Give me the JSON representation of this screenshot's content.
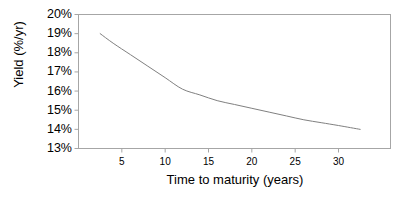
{
  "chart_data": {
    "type": "line",
    "title": "",
    "xlabel": "Time to maturity (years)",
    "ylabel": "Yield (%/yr)",
    "xlim": [
      0,
      36
    ],
    "ylim": [
      13,
      20
    ],
    "grid": false,
    "legend": null,
    "xticks": [
      5,
      10,
      15,
      20,
      25,
      30
    ],
    "xtick_labels": [
      "5",
      "10",
      "15",
      "20",
      "25",
      "30"
    ],
    "yticks": [
      13,
      14,
      15,
      16,
      17,
      18,
      19,
      20
    ],
    "ytick_labels": [
      "13%",
      "14%",
      "15%",
      "16%",
      "17%",
      "18%",
      "19%",
      "20%"
    ],
    "series": [
      {
        "name": "Yield curve",
        "color": "#808080",
        "x": [
          2.5,
          4,
          6,
          8,
          10,
          12,
          14,
          16,
          18,
          20,
          22,
          24,
          26,
          28,
          30,
          32.5
        ],
        "values": [
          19.0,
          18.5,
          17.9,
          17.3,
          16.7,
          16.1,
          15.8,
          15.5,
          15.3,
          15.1,
          14.9,
          14.7,
          14.5,
          14.35,
          14.2,
          14.0
        ]
      }
    ],
    "axis_color": "#a6a6a6",
    "text_color": "#000000",
    "background": "#ffffff"
  }
}
